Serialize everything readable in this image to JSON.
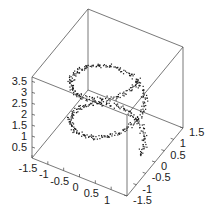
{
  "chart_data": {
    "type": "scatter",
    "subtype": "scatter3d",
    "title": "",
    "xlabel": "",
    "ylabel": "",
    "zlabel": "",
    "xlim": [
      -1.5,
      1.5
    ],
    "ylim": [
      -1.5,
      1.5
    ],
    "zlim": [
      0,
      3.7
    ],
    "x_ticks": [
      "-1.5",
      "-1",
      "-0.5",
      "0",
      "0.5",
      "1"
    ],
    "y_ticks": [
      "-1.5",
      "-1",
      "-0.5",
      "0",
      "0.5",
      "1",
      "1.5"
    ],
    "z_ticks": [
      "0.5",
      "1",
      "1.5",
      "2",
      "2.5",
      "3",
      "3.5"
    ],
    "grid": false,
    "legend": null,
    "helix": {
      "radius": 1.0,
      "turns": 2,
      "z_start": 0.0,
      "z_end": 3.5,
      "noise": 0.08,
      "n_points": 500
    },
    "marker_color": "#1a1a1a"
  },
  "axes": {
    "x_tick_labels": [
      "-1.5",
      "-1",
      "-0.5",
      "0",
      "0.5",
      "1"
    ],
    "y_tick_labels": [
      "-1.5",
      "-1",
      "-0.5",
      "0",
      "0.5",
      "1",
      "1.5"
    ],
    "z_tick_labels": [
      "0.5",
      "1",
      "1.5",
      "2",
      "2.5",
      "3",
      "3.5"
    ]
  }
}
